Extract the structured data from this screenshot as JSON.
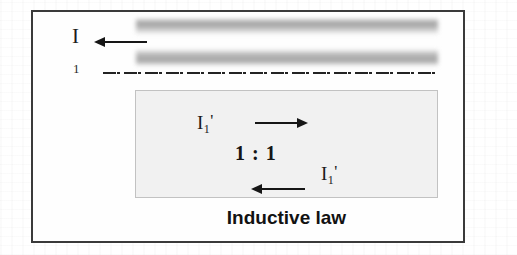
{
  "figure": {
    "caption": "Inductive law",
    "primary_current_label": "I",
    "centerline_label": "1",
    "ratio_label": "1 : 1",
    "secondary_current": {
      "symbol": "I",
      "subscript": "1",
      "prime": "'"
    },
    "arrows": {
      "primary_direction": "left",
      "secondary_top_direction": "right",
      "secondary_bottom_direction": "left"
    },
    "colors": {
      "frame_border": "#3a3a3a",
      "inner_box_fill": "#f1f1f1",
      "inner_box_border": "#c2c2c2",
      "band_gray": "#9a9a9a",
      "ink": "#161616"
    }
  }
}
